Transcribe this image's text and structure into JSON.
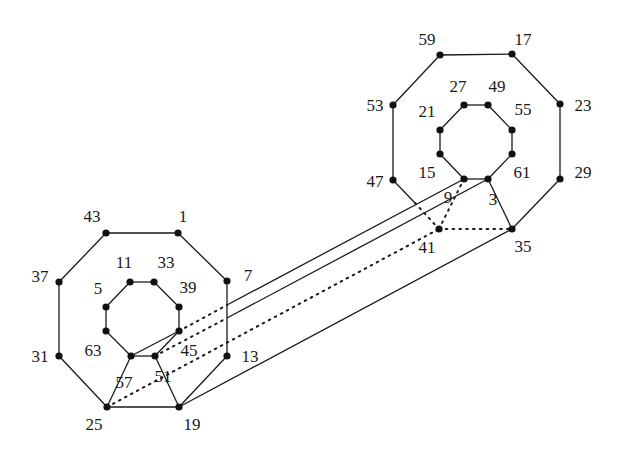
{
  "diagram": {
    "type": "graph",
    "colors": {
      "ink": "#1a1a1a",
      "background": "#ffffff"
    },
    "nodes": [
      {
        "id": "1",
        "x": 178,
        "y": 233,
        "lx": 183,
        "ly": 222
      },
      {
        "id": "7",
        "x": 227,
        "y": 281,
        "lx": 248,
        "ly": 281
      },
      {
        "id": "13",
        "x": 227,
        "y": 356,
        "lx": 250,
        "ly": 362
      },
      {
        "id": "19",
        "x": 179,
        "y": 407,
        "lx": 192,
        "ly": 430
      },
      {
        "id": "25",
        "x": 107,
        "y": 407,
        "lx": 94,
        "ly": 430
      },
      {
        "id": "31",
        "x": 59,
        "y": 356,
        "lx": 40,
        "ly": 362
      },
      {
        "id": "37",
        "x": 59,
        "y": 282,
        "lx": 40,
        "ly": 282
      },
      {
        "id": "43",
        "x": 106,
        "y": 233,
        "lx": 92,
        "ly": 222
      },
      {
        "id": "5",
        "x": 106,
        "y": 307,
        "lx": 98,
        "ly": 294
      },
      {
        "id": "11",
        "x": 130,
        "y": 282,
        "lx": 124,
        "ly": 268
      },
      {
        "id": "33",
        "x": 154,
        "y": 282,
        "lx": 166,
        "ly": 268
      },
      {
        "id": "39",
        "x": 179,
        "y": 307,
        "lx": 188,
        "ly": 293
      },
      {
        "id": "45",
        "x": 179,
        "y": 331,
        "lx": 189,
        "ly": 356
      },
      {
        "id": "51",
        "x": 155,
        "y": 356,
        "lx": 163,
        "ly": 382
      },
      {
        "id": "57",
        "x": 131,
        "y": 356,
        "lx": 124,
        "ly": 388
      },
      {
        "id": "63",
        "x": 106,
        "y": 331,
        "lx": 93,
        "ly": 356
      },
      {
        "id": "59",
        "x": 440,
        "y": 55,
        "lx": 427,
        "ly": 45
      },
      {
        "id": "17",
        "x": 512,
        "y": 54,
        "lx": 523,
        "ly": 45
      },
      {
        "id": "23",
        "x": 560,
        "y": 104,
        "lx": 583,
        "ly": 111
      },
      {
        "id": "29",
        "x": 560,
        "y": 179,
        "lx": 583,
        "ly": 178
      },
      {
        "id": "35",
        "x": 512,
        "y": 229,
        "lx": 523,
        "ly": 252
      },
      {
        "id": "41",
        "x": 439,
        "y": 229,
        "lx": 427,
        "ly": 253
      },
      {
        "id": "47",
        "x": 393,
        "y": 180,
        "lx": 375,
        "ly": 187
      },
      {
        "id": "53",
        "x": 393,
        "y": 105,
        "lx": 375,
        "ly": 111
      },
      {
        "id": "21",
        "x": 440,
        "y": 130,
        "lx": 427,
        "ly": 117
      },
      {
        "id": "27",
        "x": 464,
        "y": 105,
        "lx": 458,
        "ly": 92
      },
      {
        "id": "49",
        "x": 488,
        "y": 105,
        "lx": 497,
        "ly": 92
      },
      {
        "id": "55",
        "x": 512,
        "y": 130,
        "lx": 523,
        "ly": 115
      },
      {
        "id": "61",
        "x": 512,
        "y": 154,
        "lx": 522,
        "ly": 178
      },
      {
        "id": "3",
        "x": 488,
        "y": 179,
        "lx": 493,
        "ly": 205
      },
      {
        "id": "9",
        "x": 464,
        "y": 179,
        "lx": 448,
        "ly": 203
      },
      {
        "id": "15",
        "x": 440,
        "y": 154,
        "lx": 427,
        "ly": 178
      }
    ],
    "edges": [
      {
        "from": "43",
        "to": "1",
        "style": "solid"
      },
      {
        "from": "1",
        "to": "7",
        "style": "solid"
      },
      {
        "from": "7",
        "to": "13",
        "style": "solid"
      },
      {
        "from": "13",
        "to": "19",
        "style": "solid"
      },
      {
        "from": "19",
        "to": "25",
        "style": "solid"
      },
      {
        "from": "25",
        "to": "31",
        "style": "solid"
      },
      {
        "from": "31",
        "to": "37",
        "style": "solid"
      },
      {
        "from": "37",
        "to": "43",
        "style": "solid"
      },
      {
        "from": "11",
        "to": "33",
        "style": "solid"
      },
      {
        "from": "33",
        "to": "39",
        "style": "solid"
      },
      {
        "from": "39",
        "to": "45",
        "style": "solid"
      },
      {
        "from": "45",
        "to": "51",
        "style": "solid"
      },
      {
        "from": "51",
        "to": "57",
        "style": "solid"
      },
      {
        "from": "57",
        "to": "63",
        "style": "solid"
      },
      {
        "from": "63",
        "to": "5",
        "style": "solid"
      },
      {
        "from": "5",
        "to": "11",
        "style": "solid"
      },
      {
        "from": "57",
        "to": "45",
        "style": "solid"
      },
      {
        "from": "57",
        "to": "25",
        "style": "solid"
      },
      {
        "from": "51",
        "to": "19",
        "style": "solid"
      },
      {
        "from": "59",
        "to": "17",
        "style": "solid"
      },
      {
        "from": "17",
        "to": "23",
        "style": "solid"
      },
      {
        "from": "23",
        "to": "29",
        "style": "solid"
      },
      {
        "from": "29",
        "to": "35",
        "style": "solid"
      },
      {
        "from": "53",
        "to": "59",
        "style": "solid"
      },
      {
        "from": "47",
        "to": "53",
        "style": "solid"
      },
      {
        "from": "21",
        "to": "27",
        "style": "solid"
      },
      {
        "from": "27",
        "to": "49",
        "style": "solid"
      },
      {
        "from": "49",
        "to": "55",
        "style": "solid"
      },
      {
        "from": "55",
        "to": "61",
        "style": "solid"
      },
      {
        "from": "61",
        "to": "3",
        "style": "solid"
      },
      {
        "from": "3",
        "to": "9",
        "style": "solid"
      },
      {
        "from": "9",
        "to": "15",
        "style": "solid"
      },
      {
        "from": "15",
        "to": "21",
        "style": "solid"
      },
      {
        "from": "3",
        "to": "35",
        "style": "solid"
      },
      {
        "from": "19",
        "to": "35",
        "style": "solid"
      },
      {
        "from": "47",
        "to": "41",
        "style": "solid-then-dotted",
        "split": [
          415,
          203
        ]
      },
      {
        "from": "45",
        "to": "9",
        "style": "dotted-then-solid",
        "split": [
          227,
          305
        ]
      },
      {
        "from": "51",
        "to": "3",
        "style": "dotted-then-solid",
        "split": [
          227,
          318
        ]
      },
      {
        "from": "25",
        "to": "41",
        "style": "dotted"
      },
      {
        "from": "41",
        "to": "35",
        "style": "dotted"
      },
      {
        "from": "41",
        "to": "9",
        "style": "dotted"
      }
    ]
  }
}
